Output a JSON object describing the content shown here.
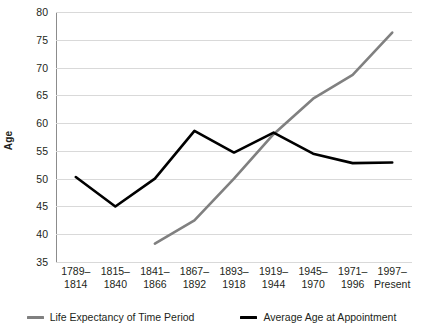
{
  "chart_data": {
    "type": "line",
    "title": "",
    "xlabel": "",
    "ylabel": "Age",
    "ylim": [
      35,
      80
    ],
    "ytick_step": 5,
    "yticks": [
      80,
      75,
      70,
      65,
      60,
      55,
      50,
      45,
      40,
      35
    ],
    "grid": true,
    "legend_position": "bottom",
    "categories": [
      "1789–\n1814",
      "1815–\n1840",
      "1841–\n1866",
      "1867–\n1892",
      "1893–\n1918",
      "1919–\n1944",
      "1945–\n1970",
      "1971–\n1996",
      "1997–\nPresent"
    ],
    "category_lines": [
      [
        "1789–",
        "1814"
      ],
      [
        "1815–",
        "1840"
      ],
      [
        "1841–",
        "1866"
      ],
      [
        "1867–",
        "1892"
      ],
      [
        "1893–",
        "1918"
      ],
      [
        "1919–",
        "1944"
      ],
      [
        "1945–",
        "1970"
      ],
      [
        "1971–",
        "1996"
      ],
      [
        "1997–",
        "Present"
      ]
    ],
    "series": [
      {
        "name": "Life Expectancy of Time Period",
        "color": "#808080",
        "values": [
          null,
          null,
          38.3,
          42.5,
          50.0,
          58.0,
          64.4,
          68.7,
          76.3
        ]
      },
      {
        "name": "Average Age at Appointment",
        "color": "#000000",
        "values": [
          50.3,
          45.0,
          50.0,
          58.6,
          54.7,
          58.3,
          54.5,
          52.8,
          52.9
        ]
      }
    ]
  },
  "legend": {
    "items": [
      {
        "label": "Life Expectancy of Time Period",
        "color": "#808080"
      },
      {
        "label": "Average Age at Appointment",
        "color": "#000000"
      }
    ]
  },
  "axis": {
    "y_title": "Age"
  }
}
